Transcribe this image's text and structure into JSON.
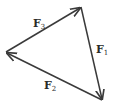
{
  "diagram": {
    "type": "vector-triangle",
    "stroke_color": "#3a3a3a",
    "vertices": {
      "top": [
        81,
        7
      ],
      "bottom_right": [
        102,
        100
      ],
      "left": [
        6,
        52
      ]
    },
    "vectors": [
      {
        "name": "F1",
        "base": "F",
        "subscript": "1",
        "from": "top",
        "to": "bottom_right"
      },
      {
        "name": "F2",
        "base": "F",
        "subscript": "2",
        "from": "bottom_right",
        "to": "left"
      },
      {
        "name": "F3",
        "base": "F",
        "subscript": "3",
        "from": "left",
        "to": "top"
      }
    ],
    "labels": {
      "f1": {
        "base": "F",
        "sub": "1"
      },
      "f2": {
        "base": "F",
        "sub": "2"
      },
      "f3": {
        "base": "F",
        "sub": "3"
      }
    }
  }
}
